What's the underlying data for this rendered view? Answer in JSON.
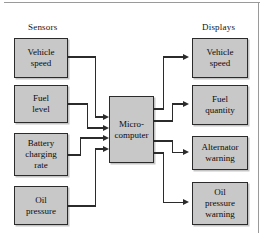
{
  "figure": {
    "background_color": "#ffffff",
    "box_fill_color": "#c8c8c8",
    "box_border_color": "#2b2b2b",
    "wire_color": "#2b2b2b",
    "frame_line_color": "#9a9a9a"
  },
  "headings": {
    "left": "Sensors",
    "right": "Displays"
  },
  "sensors": [
    {
      "id": "vehicle-speed-sensor",
      "label": "Vehicle\nspeed"
    },
    {
      "id": "fuel-level-sensor",
      "label": "Fuel\nlevel"
    },
    {
      "id": "battery-sensor",
      "label": "Battery\ncharging\nrate"
    },
    {
      "id": "oil-pressure-sensor",
      "label": "Oil\npressure"
    }
  ],
  "processor": {
    "id": "microcomputer",
    "label": "Micro-\ncomputer"
  },
  "displays": [
    {
      "id": "vehicle-speed-display",
      "label": "Vehicle\nspeed"
    },
    {
      "id": "fuel-quantity-display",
      "label": "Fuel\nquantity"
    },
    {
      "id": "alternator-display",
      "label": "Alternator\nwarning"
    },
    {
      "id": "oil-warning-display",
      "label": "Oil\npressure\nwarning"
    }
  ],
  "connections": {
    "inputs": [
      {
        "from": "vehicle-speed-sensor",
        "to": "microcomputer"
      },
      {
        "from": "fuel-level-sensor",
        "to": "microcomputer"
      },
      {
        "from": "battery-sensor",
        "to": "microcomputer"
      },
      {
        "from": "oil-pressure-sensor",
        "to": "microcomputer"
      }
    ],
    "outputs": [
      {
        "from": "microcomputer",
        "to": "vehicle-speed-display"
      },
      {
        "from": "microcomputer",
        "to": "fuel-quantity-display"
      },
      {
        "from": "microcomputer",
        "to": "alternator-display"
      },
      {
        "from": "microcomputer",
        "to": "oil-warning-display"
      }
    ]
  }
}
